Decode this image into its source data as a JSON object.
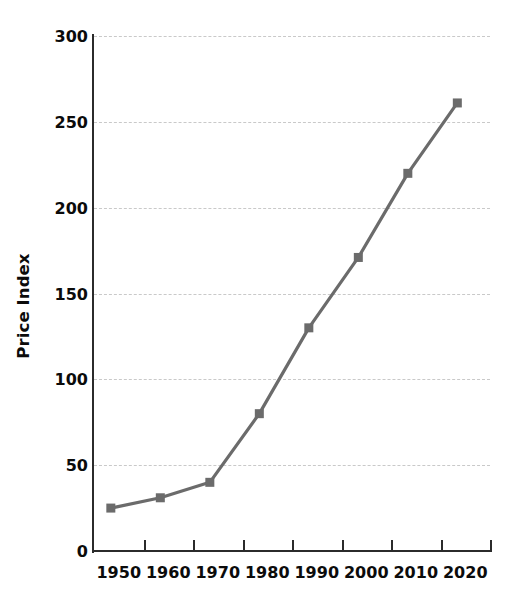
{
  "chart_data": {
    "type": "line",
    "title": "",
    "xlabel": "",
    "ylabel": "Price Index",
    "categories": [
      1950,
      1960,
      1970,
      1980,
      1990,
      2000,
      2010,
      2020
    ],
    "x_tick_labels": [
      "1950",
      "1960",
      "1970",
      "1980",
      "1990",
      "2000",
      "2010",
      "2020"
    ],
    "values": [
      25,
      31,
      40,
      80,
      130,
      171,
      220,
      261
    ],
    "series": [
      {
        "name": "Price Index",
        "values": [
          25,
          31,
          40,
          80,
          130,
          171,
          220,
          261
        ]
      }
    ],
    "ylim": [
      0,
      300
    ],
    "y_ticks": [
      0,
      50,
      100,
      150,
      200,
      250,
      300
    ],
    "y_tick_labels": [
      "0",
      "50",
      "100",
      "150",
      "200",
      "250",
      "300"
    ],
    "grid": "horizontal-dashed",
    "legend": "none",
    "marker": "square",
    "line_color": "#6b6b6b",
    "marker_color": "#6b6b6b",
    "grid_color": "#c9c9c9",
    "axis_color": "#2b2b2b",
    "text_color": "#0b0b0b",
    "background_color": "#ffffff"
  }
}
